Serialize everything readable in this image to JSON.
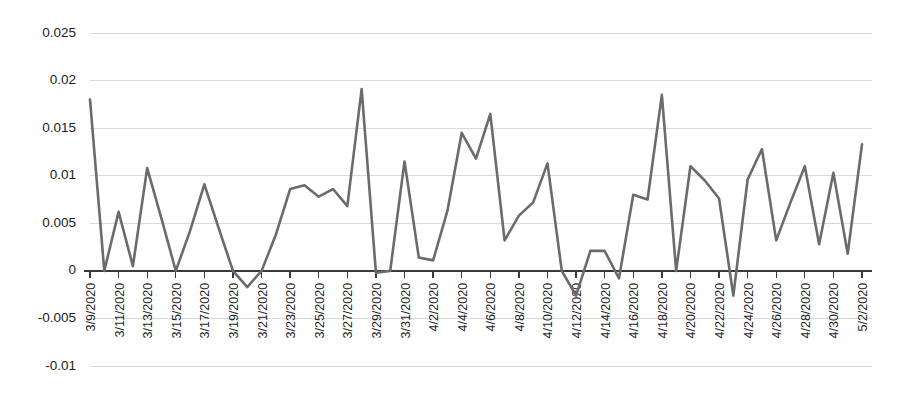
{
  "chart_data": {
    "type": "line",
    "title": "",
    "subtitle": "",
    "xlabel": "",
    "ylabel": "",
    "grid": true,
    "legend": false,
    "legend_position": "none",
    "line_color": "#6b6b6b",
    "ylim": [
      -0.01,
      0.025
    ],
    "ytick_labels": [
      "0.025",
      "0.02",
      "0.015",
      "0.01",
      "0.005",
      "0",
      "-0.005",
      "-0.01"
    ],
    "ytick_values": [
      0.025,
      0.02,
      0.015,
      0.01,
      0.005,
      0,
      -0.005,
      -0.01
    ],
    "xtick_labels": [
      "3/9/2020",
      "3/11/2020",
      "3/13/2020",
      "3/15/2020",
      "3/17/2020",
      "3/19/2020",
      "3/21/2020",
      "3/23/2020",
      "3/25/2020",
      "3/27/2020",
      "3/29/2020",
      "3/31/2020",
      "4/2/2020",
      "4/4/2020",
      "4/6/2020",
      "4/8/2020",
      "4/10/2020",
      "4/12/2020",
      "4/14/2020",
      "4/16/2020",
      "4/18/2020",
      "4/20/2020",
      "4/22/2020",
      "4/24/2020",
      "4/26/2020",
      "4/28/2020",
      "4/30/2020",
      "5/2/2020"
    ],
    "x": [
      "3/9/2020",
      "3/10/2020",
      "3/11/2020",
      "3/12/2020",
      "3/13/2020",
      "3/14/2020",
      "3/15/2020",
      "3/16/2020",
      "3/17/2020",
      "3/18/2020",
      "3/19/2020",
      "3/20/2020",
      "3/21/2020",
      "3/22/2020",
      "3/23/2020",
      "3/24/2020",
      "3/25/2020",
      "3/26/2020",
      "3/27/2020",
      "3/28/2020",
      "3/29/2020",
      "3/30/2020",
      "3/31/2020",
      "4/1/2020",
      "4/2/2020",
      "4/3/2020",
      "4/4/2020",
      "4/5/2020",
      "4/6/2020",
      "4/7/2020",
      "4/8/2020",
      "4/9/2020",
      "4/10/2020",
      "4/11/2020",
      "4/12/2020",
      "4/13/2020",
      "4/14/2020",
      "4/15/2020",
      "4/16/2020",
      "4/17/2020",
      "4/18/2020",
      "4/19/2020",
      "4/20/2020",
      "4/21/2020",
      "4/22/2020",
      "4/23/2020",
      "4/24/2020",
      "4/25/2020",
      "4/26/2020",
      "4/27/2020",
      "4/28/2020",
      "4/29/2020",
      "4/30/2020",
      "5/1/2020",
      "5/2/2020"
    ],
    "values": [
      0.018,
      0.0,
      0.0062,
      0.0005,
      0.0108,
      0.0055,
      0.0,
      0.0042,
      0.0091,
      0.0045,
      0.0,
      -0.0017,
      0.0,
      0.0038,
      0.0086,
      0.009,
      0.0078,
      0.0086,
      0.0068,
      0.0191,
      -0.0002,
      0.0,
      0.0115,
      0.0014,
      0.0011,
      0.0063,
      0.0145,
      0.0118,
      0.0165,
      0.0032,
      0.0058,
      0.0072,
      0.0113,
      0.0,
      -0.0026,
      0.0021,
      0.0021,
      -0.0008,
      0.008,
      0.0075,
      0.0185,
      0.0,
      0.011,
      0.0095,
      0.0076,
      -0.0026,
      0.0096,
      0.0128,
      0.0032,
      0.0072,
      0.011,
      0.0028,
      0.0103,
      0.0018,
      0.0133
    ]
  }
}
